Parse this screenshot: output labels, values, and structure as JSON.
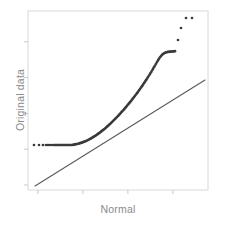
{
  "figure": {
    "name": "normal-qq-plot",
    "background_color": "#ffffff"
  },
  "axes": {
    "x_label": "Normal",
    "y_label": "Original data",
    "label_color": "#8a8a8a",
    "frame_color": "#d8d8d8",
    "tick_color": "#c9c9c9",
    "x_tick_count": 4,
    "y_tick_count": 5,
    "x_tick_labels": [],
    "y_tick_labels": []
  },
  "style": {
    "point_color": "#3a3a3a",
    "reference_line_color": "#5a5a5a",
    "point_radius": 1.35,
    "reference_line_width": 1.1
  },
  "chart_data": {
    "type": "scatter",
    "title": "",
    "subtitle": "",
    "xlabel": "Normal",
    "ylabel": "Original data",
    "xlim": [
      28,
      208
    ],
    "ylim": [
      11,
      190
    ],
    "grid": false,
    "legend": null,
    "annotations": [],
    "series": [
      {
        "name": "Sample quantiles",
        "kind": "points",
        "x": [
          34,
          39,
          43,
          46,
          48,
          50,
          52,
          54,
          55,
          56,
          57,
          58,
          59,
          60,
          61,
          62,
          63,
          64,
          65,
          66,
          67,
          68,
          69,
          70,
          71,
          72,
          73,
          74,
          75,
          76,
          77,
          78,
          79,
          80,
          81,
          82,
          83,
          84,
          85,
          86,
          87,
          88,
          89,
          90,
          91,
          92,
          93,
          94,
          95,
          96,
          97,
          98,
          99,
          100,
          101,
          102,
          103,
          104,
          105,
          106,
          107,
          108,
          109,
          110,
          111,
          112,
          113,
          114,
          115,
          116,
          117,
          118,
          119,
          120,
          121,
          122,
          123,
          124,
          125,
          126,
          127,
          128,
          129,
          130,
          131,
          132,
          133,
          134,
          135,
          136,
          137,
          138,
          139,
          140,
          141,
          142,
          143,
          144,
          145,
          146,
          147,
          148,
          149,
          150,
          151,
          152,
          153,
          154,
          155,
          156,
          157,
          158,
          159,
          160,
          161,
          162,
          163,
          164,
          165,
          166,
          167,
          168,
          169,
          170,
          171,
          172,
          173,
          174,
          175,
          178,
          181,
          186,
          192
        ],
        "y": [
          145,
          145,
          145,
          145,
          145,
          145,
          145,
          145,
          145,
          145,
          145,
          145,
          145,
          145,
          145,
          145,
          145,
          145,
          145,
          145,
          145,
          145,
          145,
          145,
          145,
          145,
          144.8,
          144.6,
          144.4,
          144.2,
          144,
          143.8,
          143.5,
          143.2,
          142.9,
          142.6,
          142.2,
          141.8,
          141.4,
          141,
          140.5,
          140,
          139.5,
          139,
          138.4,
          137.8,
          137.2,
          136.6,
          136,
          135.3,
          134.6,
          133.9,
          133.2,
          132.5,
          131.7,
          130.9,
          130.1,
          129.3,
          128.5,
          127.6,
          126.7,
          125.8,
          124.9,
          124,
          123,
          122,
          121,
          120,
          119,
          118,
          117,
          116,
          114.9,
          113.8,
          112.7,
          111.6,
          110.5,
          109.4,
          108.2,
          107,
          105.8,
          104.6,
          103.4,
          102.2,
          101,
          99.7,
          98.4,
          97.1,
          95.8,
          94.5,
          93.2,
          91.8,
          90.4,
          89,
          87.6,
          86.2,
          84.7,
          83.2,
          81.7,
          80.2,
          78.7,
          77.1,
          75.5,
          73.9,
          72.3,
          70.6,
          68.9,
          67.2,
          65.5,
          63.8,
          62.1,
          60.4,
          58.8,
          57.3,
          56,
          54.9,
          54,
          53.3,
          52.8,
          52.4,
          52.1,
          51.9,
          51.8,
          51.7,
          51.6,
          51.5,
          51.4,
          51.3,
          51.2,
          40,
          28,
          18,
          18
        ]
      },
      {
        "name": "Reference line",
        "kind": "line",
        "x": [
          35,
          205
        ],
        "y": [
          186,
          80
        ]
      }
    ]
  }
}
